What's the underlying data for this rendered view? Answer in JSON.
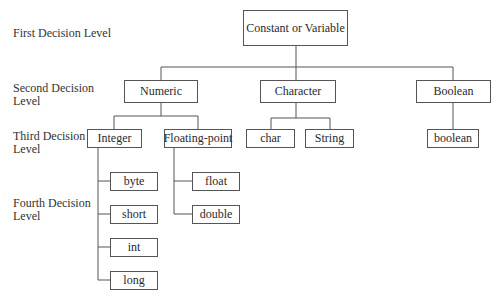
{
  "diagram": {
    "level_labels": [
      "First Decision Level",
      "Second Decision\nLevel",
      "Third Decision\nLevel",
      "Fourth Decision\nLevel"
    ],
    "level_label_lines": {
      "first": [
        "First Decision Level"
      ],
      "second": [
        "Second Decision",
        "Level"
      ],
      "third": [
        "Third Decision",
        "Level"
      ],
      "fourth": [
        "Fourth Decision",
        "Level"
      ]
    },
    "root": "Constant or Variable",
    "second_level": [
      "Numeric",
      "Character",
      "Boolean"
    ],
    "third_level": {
      "numeric": [
        "Integer",
        "Floating-point"
      ],
      "character": [
        "char",
        "String"
      ],
      "boolean": [
        "boolean"
      ]
    },
    "fourth_level": {
      "integer": [
        "byte",
        "short",
        "int",
        "long"
      ],
      "floating_point": [
        "float",
        "double"
      ]
    },
    "colors": {
      "line": "#555555",
      "text": "#2a2a2a",
      "background": "#ffffff"
    }
  }
}
